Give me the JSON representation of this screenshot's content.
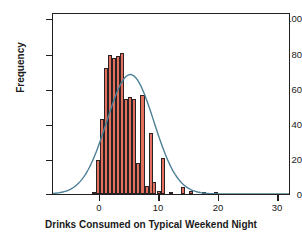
{
  "chart_data": {
    "type": "bar",
    "title": "",
    "subtitle": "",
    "xlabel": "Drinks Consumed on Typical Weekend Night",
    "ylabel": "Frequency",
    "xlim": [
      -6.5,
      33.5
    ],
    "ylim": [
      0,
      107
    ],
    "xticks": [
      0,
      10,
      20,
      30
    ],
    "xtick_labels": [
      "0",
      "10",
      "20",
      "30"
    ],
    "yticks": [
      0,
      20,
      40,
      60,
      80,
      100
    ],
    "ytick_labels": [
      "0",
      "20",
      "40",
      "60",
      "80",
      "100"
    ],
    "grid": false,
    "legend": "none",
    "bar_color": "#e2705c",
    "bar_edge_color": "#2a2326",
    "curve_color": "#4a7f96",
    "axis_color": "#231f20",
    "bin_width": 0.68,
    "categories": [
      "0.0",
      "0.7",
      "1.4",
      "2.0",
      "2.7",
      "3.4",
      "4.1",
      "4.8",
      "5.5",
      "6.1",
      "6.8",
      "7.5",
      "8.2",
      "8.9",
      "9.6",
      "10.2",
      "10.9",
      "11.6",
      "12.3",
      "13.0",
      "13.7",
      "14.3",
      "15.0",
      "15.7",
      "17.7",
      "19.8",
      "23.2",
      "25.3"
    ],
    "values": [
      1,
      20,
      44,
      74,
      82,
      80,
      81,
      83,
      56,
      57,
      56,
      18,
      58,
      5,
      36,
      7,
      2,
      21,
      1,
      0,
      0,
      0,
      0,
      0,
      4,
      2,
      1,
      1
    ],
    "bars": [
      {
        "x": 0.0,
        "frequency": 1
      },
      {
        "x": 0.7,
        "frequency": 20
      },
      {
        "x": 1.4,
        "frequency": 44
      },
      {
        "x": 2.0,
        "frequency": 74
      },
      {
        "x": 2.7,
        "frequency": 82
      },
      {
        "x": 3.4,
        "frequency": 80
      },
      {
        "x": 4.1,
        "frequency": 81
      },
      {
        "x": 4.8,
        "frequency": 83
      },
      {
        "x": 5.5,
        "frequency": 56
      },
      {
        "x": 6.1,
        "frequency": 57
      },
      {
        "x": 6.8,
        "frequency": 56
      },
      {
        "x": 7.5,
        "frequency": 18
      },
      {
        "x": 8.2,
        "frequency": 58
      },
      {
        "x": 8.9,
        "frequency": 5
      },
      {
        "x": 9.6,
        "frequency": 36
      },
      {
        "x": 10.2,
        "frequency": 7
      },
      {
        "x": 10.9,
        "frequency": 2
      },
      {
        "x": 11.6,
        "frequency": 21
      },
      {
        "x": 13.0,
        "frequency": 1
      },
      {
        "x": 15.0,
        "frequency": 4
      },
      {
        "x": 16.4,
        "frequency": 2
      },
      {
        "x": 18.5,
        "frequency": 1
      },
      {
        "x": 20.5,
        "frequency": 1
      }
    ],
    "normal_curve": {
      "mean": 6.6,
      "sd": 4.0,
      "peak_frequency": 71,
      "color": "#4a7f96",
      "description": "overlaid normal density curve"
    },
    "annotations": []
  }
}
